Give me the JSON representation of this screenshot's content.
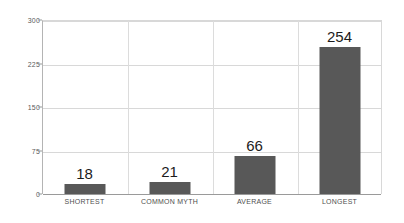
{
  "chart_data": {
    "type": "bar",
    "title": "",
    "subtitle": "",
    "xlabel": "",
    "ylabel": "",
    "categories": [
      "SHORTEST",
      "COMMON MYTH",
      "AVERAGE",
      "LONGEST"
    ],
    "values": [
      18,
      21,
      66,
      254
    ],
    "data_labels": [
      "18",
      "21",
      "66",
      "254"
    ],
    "ylim": [
      0,
      300
    ],
    "yticks": [
      0,
      75,
      150,
      225,
      300
    ],
    "ytick_labels": [
      "0",
      "75",
      "150",
      "225",
      "300"
    ],
    "grid": {
      "horizontal": true,
      "vertical": true,
      "vertical_between_categories": true
    },
    "legend": {
      "visible": false,
      "position": "none"
    },
    "colors": {
      "bar": "#585858",
      "background": "#ffffff",
      "gridline": "#d8d8d8",
      "axis": "#9a9a9a",
      "tick_text": "#5a5a5a",
      "category_text": "#4f4f4f",
      "value_text": "#1c1c1c"
    }
  }
}
